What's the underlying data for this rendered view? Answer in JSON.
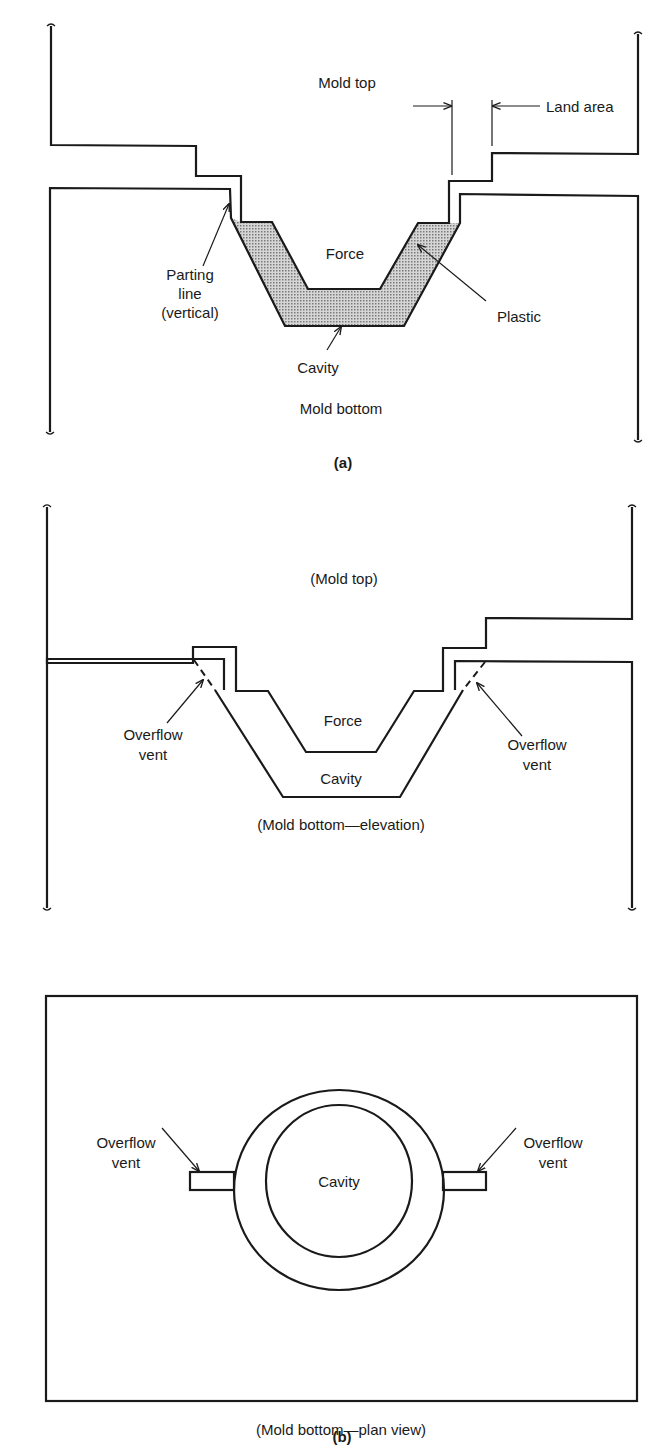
{
  "figure_a": {
    "caption": "(a)",
    "labels": {
      "mold_top": "Mold top",
      "land_area": "Land area",
      "force": "Force",
      "parting_line_1": "Parting",
      "parting_line_2": "line",
      "parting_line_3": "(vertical)",
      "plastic": "Plastic",
      "cavity": "Cavity",
      "mold_bottom": "Mold bottom"
    }
  },
  "figure_b": {
    "caption": "(b)",
    "elevation": {
      "mold_top": "(Mold top)",
      "force": "Force",
      "cavity": "Cavity",
      "vent_left_1": "Overflow",
      "vent_left_2": "vent",
      "vent_right_1": "Overflow",
      "vent_right_2": "vent",
      "title": "(Mold bottom—elevation)"
    },
    "plan": {
      "cavity": "Cavity",
      "vent_left_1": "Overflow",
      "vent_left_2": "vent",
      "vent_right_1": "Overflow",
      "vent_right_2": "vent",
      "title": "(Mold bottom—plan view)"
    }
  },
  "colors": {
    "line": "#1a1a1a",
    "plastic_fill": "#b8b8b8",
    "background": "#ffffff"
  }
}
